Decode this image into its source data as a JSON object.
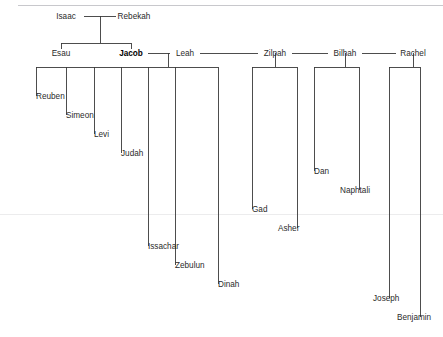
{
  "diagram": {
    "type": "family-tree",
    "title_text": "",
    "line_color": "#3a3a3a",
    "text_color": "#2b2b2b",
    "background": "#ffffff",
    "top_rule_color": "#c8c8cc",
    "faint_rule_color": "#ececed"
  },
  "people": [
    {
      "id": "isaac",
      "label": "Isaac",
      "x": 66,
      "y": 19,
      "anchor": "middle",
      "bold": false
    },
    {
      "id": "rebekah",
      "label": "Rebekah",
      "x": 134,
      "y": 19,
      "anchor": "middle",
      "bold": false
    },
    {
      "id": "esau",
      "label": "Esau",
      "x": 61,
      "y": 56,
      "anchor": "middle",
      "bold": false
    },
    {
      "id": "jacob",
      "label": "Jacob",
      "x": 131,
      "y": 56,
      "anchor": "middle",
      "bold": true
    },
    {
      "id": "leah",
      "label": "Leah",
      "x": 185,
      "y": 56,
      "anchor": "middle",
      "bold": false
    },
    {
      "id": "zilpah",
      "label": "Zilpah",
      "x": 275,
      "y": 56,
      "anchor": "middle",
      "bold": false
    },
    {
      "id": "bilhah",
      "label": "Bilhah",
      "x": 345,
      "y": 56,
      "anchor": "middle",
      "bold": false
    },
    {
      "id": "rachel",
      "label": "Rachel",
      "x": 413,
      "y": 56,
      "anchor": "middle",
      "bold": false
    },
    {
      "id": "reuben",
      "label": "Reuben",
      "x": 36,
      "y": 99,
      "anchor": "start",
      "bold": false
    },
    {
      "id": "simeon",
      "label": "Simeon",
      "x": 66,
      "y": 118,
      "anchor": "start",
      "bold": false
    },
    {
      "id": "levi",
      "label": "Levi",
      "x": 94,
      "y": 137,
      "anchor": "start",
      "bold": false
    },
    {
      "id": "judah",
      "label": "Judah",
      "x": 121,
      "y": 156,
      "anchor": "start",
      "bold": false
    },
    {
      "id": "issachar",
      "label": "Issachar",
      "x": 148,
      "y": 249,
      "anchor": "start",
      "bold": false
    },
    {
      "id": "zebulun",
      "label": "Zebulun",
      "x": 175,
      "y": 268,
      "anchor": "start",
      "bold": false
    },
    {
      "id": "dinah",
      "label": "Dinah",
      "x": 218,
      "y": 287,
      "anchor": "start",
      "bold": false
    },
    {
      "id": "gad",
      "label": "Gad",
      "x": 252,
      "y": 212,
      "anchor": "start",
      "bold": false
    },
    {
      "id": "asher",
      "label": "Asher",
      "x": 278,
      "y": 231,
      "anchor": "start",
      "bold": false
    },
    {
      "id": "dan",
      "label": "Dan",
      "x": 314,
      "y": 174,
      "anchor": "start",
      "bold": false
    },
    {
      "id": "naphtali",
      "label": "Naphtali",
      "x": 340,
      "y": 193,
      "anchor": "start",
      "bold": false
    },
    {
      "id": "joseph",
      "label": "Joseph",
      "x": 373,
      "y": 301,
      "anchor": "start",
      "bold": false
    },
    {
      "id": "benjamin",
      "label": "Benjamin",
      "x": 397,
      "y": 320,
      "anchor": "start",
      "bold": false
    }
  ],
  "edges": [
    {
      "id": "isaac-rebekah-spouse",
      "d": "M 84 16 L 116 16"
    },
    {
      "id": "isaac-rebekah-stem",
      "d": "M 100 16 L 100 43"
    },
    {
      "id": "esau-jacob-bar",
      "d": "M 61 43 L 131 43"
    },
    {
      "id": "esau-drop",
      "d": "M 61 43 L 61 49"
    },
    {
      "id": "jacob-drop",
      "d": "M 131 43 L 131 49"
    },
    {
      "id": "jacob-leah-spouse",
      "d": "M 148 53 L 170 53"
    },
    {
      "id": "leah-zilpah-spouse",
      "d": "M 200 53 L 258 53"
    },
    {
      "id": "zilpah-bilhah-spouse",
      "d": "M 292 53 L 328 53"
    },
    {
      "id": "bilhah-rachel-spouse",
      "d": "M 362 53 L 396 53"
    },
    {
      "id": "leah-stem",
      "d": "M 168 53 L 168 67"
    },
    {
      "id": "leah-children-bar",
      "d": "M 36 67 L 218 67"
    },
    {
      "id": "zilpah-stem",
      "d": "M 275 53 L 275 67"
    },
    {
      "id": "zilpah-children-bar",
      "d": "M 252 67 L 297 67"
    },
    {
      "id": "bilhah-stem",
      "d": "M 345 53 L 345 67"
    },
    {
      "id": "bilhah-children-bar",
      "d": "M 314 67 L 359 67"
    },
    {
      "id": "rachel-stem",
      "d": "M 413 53 L 413 67"
    },
    {
      "id": "rachel-children-bar",
      "d": "M 389 67 L 420 67"
    },
    {
      "id": "reuben-line",
      "d": "M 36 67 L 36 96"
    },
    {
      "id": "simeon-line",
      "d": "M 66 67 L 66 115"
    },
    {
      "id": "levi-line",
      "d": "M 94 67 L 94 134"
    },
    {
      "id": "judah-line",
      "d": "M 121 67 L 121 153"
    },
    {
      "id": "issachar-line",
      "d": "M 148 67 L 148 246"
    },
    {
      "id": "zebulun-line",
      "d": "M 175 67 L 175 265"
    },
    {
      "id": "dinah-line",
      "d": "M 218 67 L 218 284"
    },
    {
      "id": "gad-line",
      "d": "M 252 67 L 252 209"
    },
    {
      "id": "asher-line",
      "d": "M 297 67 L 297 228"
    },
    {
      "id": "dan-line",
      "d": "M 314 67 L 314 171"
    },
    {
      "id": "naphtali-line",
      "d": "M 359 67 L 359 190"
    },
    {
      "id": "joseph-line",
      "d": "M 389 67 L 389 298"
    },
    {
      "id": "benjamin-line",
      "d": "M 420 67 L 420 317"
    }
  ],
  "rules": [
    {
      "id": "top-rule",
      "d": "M 18 5 L 443 5",
      "kind": "top"
    },
    {
      "id": "faint-rule",
      "d": "M 0 214 L 443 214",
      "kind": "faint"
    }
  ]
}
